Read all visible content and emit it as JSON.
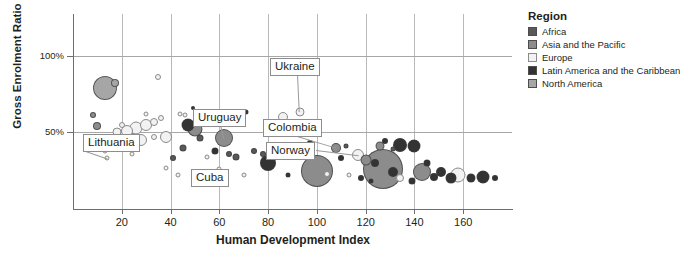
{
  "chart_data": {
    "type": "scatter",
    "title": "",
    "xlabel": "Human Development Index",
    "ylabel": "Gross Enrolment Ratio",
    "xlim": [
      0,
      180
    ],
    "ylim": [
      0,
      127
    ],
    "xticks": [
      20,
      40,
      60,
      80,
      100,
      120,
      140,
      160
    ],
    "yticks": [
      50,
      100
    ],
    "ytick_labels": [
      "50%",
      "100%"
    ],
    "grid": "both",
    "legend_position": "right",
    "legend_title": "Region",
    "series": [
      {
        "name": "Africa",
        "color": "#595959"
      },
      {
        "name": "Asia and the Pacific",
        "color": "#8c8c8c"
      },
      {
        "name": "Europe",
        "color": "#f2f2f2"
      },
      {
        "name": "Latin America and the Caribbean",
        "color": "#333333"
      },
      {
        "name": "North America",
        "color": "#a6a6a6"
      }
    ],
    "annotations": [
      {
        "label": "Lithuania",
        "x": 14,
        "y": 33
      },
      {
        "label": "Uruguay",
        "x": 62,
        "y": 46
      },
      {
        "label": "Cuba",
        "x": 60,
        "y": 26
      },
      {
        "label": "Ukraine",
        "x": 93,
        "y": 63
      },
      {
        "label": "Colombia",
        "x": 108,
        "y": 40
      },
      {
        "label": "Norway",
        "x": 117,
        "y": 35
      }
    ],
    "points": [
      {
        "x": 8,
        "y": 61,
        "r": 3.0,
        "region": "Asia and the Pacific"
      },
      {
        "x": 10,
        "y": 54,
        "r": 4.0,
        "region": "Asia and the Pacific"
      },
      {
        "x": 13,
        "y": 79,
        "r": 12.0,
        "region": "North America"
      },
      {
        "x": 17,
        "y": 82,
        "r": 4.0,
        "region": "North America"
      },
      {
        "x": 11,
        "y": 44,
        "r": 2.5,
        "region": "Europe"
      },
      {
        "x": 15,
        "y": 47,
        "r": 3.0,
        "region": "Europe"
      },
      {
        "x": 13,
        "y": 38,
        "r": 2.5,
        "region": "Europe"
      },
      {
        "x": 18,
        "y": 50,
        "r": 4.5,
        "region": "Europe"
      },
      {
        "x": 20,
        "y": 55,
        "r": 3.0,
        "region": "Europe"
      },
      {
        "x": 22,
        "y": 51,
        "r": 6.0,
        "region": "Europe"
      },
      {
        "x": 26,
        "y": 53,
        "r": 6.5,
        "region": "Europe"
      },
      {
        "x": 30,
        "y": 55,
        "r": 6.0,
        "region": "Europe"
      },
      {
        "x": 33,
        "y": 57,
        "r": 4.0,
        "region": "Europe"
      },
      {
        "x": 36,
        "y": 59,
        "r": 3.0,
        "region": "Europe"
      },
      {
        "x": 24,
        "y": 45,
        "r": 8.5,
        "region": "Asia and the Pacific"
      },
      {
        "x": 28,
        "y": 45,
        "r": 6.0,
        "region": "Europe"
      },
      {
        "x": 33,
        "y": 47,
        "r": 3.0,
        "region": "Europe"
      },
      {
        "x": 38,
        "y": 47,
        "r": 6.0,
        "region": "Europe"
      },
      {
        "x": 35,
        "y": 86,
        "r": 3.0,
        "region": "Europe"
      },
      {
        "x": 30,
        "y": 62,
        "r": 2.5,
        "region": "Europe"
      },
      {
        "x": 14,
        "y": 33,
        "r": 2.5,
        "region": "Europe"
      },
      {
        "x": 24,
        "y": 36,
        "r": 2.5,
        "region": "Europe"
      },
      {
        "x": 44,
        "y": 62,
        "r": 2.5,
        "region": "Europe"
      },
      {
        "x": 47,
        "y": 55,
        "r": 6.5,
        "region": "Latin America and the Caribbean"
      },
      {
        "x": 50,
        "y": 52,
        "r": 7.5,
        "region": "Asia and the Pacific"
      },
      {
        "x": 46,
        "y": 61,
        "r": 2.5,
        "region": "Europe"
      },
      {
        "x": 49,
        "y": 66,
        "r": 2.0,
        "region": "Latin America and the Caribbean"
      },
      {
        "x": 52,
        "y": 46,
        "r": 3.5,
        "region": "Africa"
      },
      {
        "x": 45,
        "y": 40,
        "r": 3.5,
        "region": "Africa"
      },
      {
        "x": 41,
        "y": 33,
        "r": 3.0,
        "region": "Africa"
      },
      {
        "x": 38,
        "y": 27,
        "r": 2.5,
        "region": "Europe"
      },
      {
        "x": 55,
        "y": 34,
        "r": 2.5,
        "region": "Europe"
      },
      {
        "x": 58,
        "y": 38,
        "r": 3.5,
        "region": "Latin America and the Caribbean"
      },
      {
        "x": 60,
        "y": 26,
        "r": 2.5,
        "region": "Europe"
      },
      {
        "x": 62,
        "y": 46,
        "r": 9.0,
        "region": "Asia and the Pacific"
      },
      {
        "x": 64,
        "y": 36,
        "r": 3.0,
        "region": "Africa"
      },
      {
        "x": 67,
        "y": 34,
        "r": 3.5,
        "region": "Africa"
      },
      {
        "x": 60,
        "y": 63,
        "r": 2.5,
        "region": "Europe"
      },
      {
        "x": 71,
        "y": 63,
        "r": 2.5,
        "region": "Latin America and the Caribbean"
      },
      {
        "x": 74,
        "y": 38,
        "r": 3.0,
        "region": "Africa"
      },
      {
        "x": 78,
        "y": 36,
        "r": 3.0,
        "region": "Africa"
      },
      {
        "x": 80,
        "y": 30,
        "r": 8.0,
        "region": "Latin America and the Caribbean"
      },
      {
        "x": 86,
        "y": 60,
        "r": 5.0,
        "region": "Europe"
      },
      {
        "x": 93,
        "y": 63,
        "r": 4.5,
        "region": "Europe"
      },
      {
        "x": 90,
        "y": 41,
        "r": 4.0,
        "region": "Africa"
      },
      {
        "x": 95,
        "y": 36,
        "r": 4.5,
        "region": "Asia and the Pacific"
      },
      {
        "x": 97,
        "y": 43,
        "r": 3.0,
        "region": "Latin America and the Caribbean"
      },
      {
        "x": 100,
        "y": 25,
        "r": 16.0,
        "region": "Asia and the Pacific"
      },
      {
        "x": 104,
        "y": 23,
        "r": 3.0,
        "region": "Europe"
      },
      {
        "x": 108,
        "y": 40,
        "r": 5.0,
        "region": "Asia and the Pacific"
      },
      {
        "x": 112,
        "y": 41,
        "r": 2.5,
        "region": "Africa"
      },
      {
        "x": 117,
        "y": 35,
        "r": 6.0,
        "region": "Europe"
      },
      {
        "x": 110,
        "y": 33,
        "r": 3.0,
        "region": "Latin America and the Caribbean"
      },
      {
        "x": 120,
        "y": 32,
        "r": 5.5,
        "region": "Asia and the Pacific"
      },
      {
        "x": 124,
        "y": 30,
        "r": 4.0,
        "region": "Latin America and the Caribbean"
      },
      {
        "x": 126,
        "y": 41,
        "r": 4.5,
        "region": "Asia and the Pacific"
      },
      {
        "x": 131,
        "y": 39,
        "r": 2.5,
        "region": "Africa"
      },
      {
        "x": 128,
        "y": 44,
        "r": 3.0,
        "region": "Latin America and the Caribbean"
      },
      {
        "x": 134,
        "y": 42,
        "r": 7.0,
        "region": "Latin America and the Caribbean"
      },
      {
        "x": 140,
        "y": 41,
        "r": 6.5,
        "region": "Latin America and the Caribbean"
      },
      {
        "x": 127,
        "y": 26,
        "r": 20.0,
        "region": "Asia and the Pacific"
      },
      {
        "x": 131,
        "y": 24,
        "r": 5.0,
        "region": "Latin America and the Caribbean"
      },
      {
        "x": 134,
        "y": 20,
        "r": 4.0,
        "region": "Europe"
      },
      {
        "x": 143,
        "y": 24,
        "r": 9.0,
        "region": "Asia and the Pacific"
      },
      {
        "x": 139,
        "y": 18,
        "r": 3.5,
        "region": "Latin America and the Caribbean"
      },
      {
        "x": 148,
        "y": 21,
        "r": 4.0,
        "region": "Latin America and the Caribbean"
      },
      {
        "x": 151,
        "y": 24,
        "r": 5.0,
        "region": "Latin America and the Caribbean"
      },
      {
        "x": 155,
        "y": 20,
        "r": 5.5,
        "region": "Latin America and the Caribbean"
      },
      {
        "x": 158,
        "y": 22,
        "r": 7.5,
        "region": "Europe"
      },
      {
        "x": 163,
        "y": 20,
        "r": 4.5,
        "region": "Latin America and the Caribbean"
      },
      {
        "x": 168,
        "y": 21,
        "r": 6.5,
        "region": "Latin America and the Caribbean"
      },
      {
        "x": 173,
        "y": 20,
        "r": 3.0,
        "region": "Latin America and the Caribbean"
      },
      {
        "x": 145,
        "y": 30,
        "r": 3.5,
        "region": "Latin America and the Caribbean"
      },
      {
        "x": 118,
        "y": 20,
        "r": 3.0,
        "region": "Latin America and the Caribbean"
      },
      {
        "x": 113,
        "y": 22,
        "r": 2.5,
        "region": "Europe"
      },
      {
        "x": 122,
        "y": 18,
        "r": 2.5,
        "region": "Latin America and the Caribbean"
      },
      {
        "x": 88,
        "y": 22,
        "r": 2.5,
        "region": "Latin America and the Caribbean"
      },
      {
        "x": 70,
        "y": 22,
        "r": 2.5,
        "region": "Europe"
      },
      {
        "x": 55,
        "y": 20,
        "r": 2.5,
        "region": "Europe"
      },
      {
        "x": 43,
        "y": 22,
        "r": 2.5,
        "region": "Europe"
      }
    ]
  },
  "legend": {
    "title": "Region",
    "items": [
      {
        "label": "Africa",
        "color": "#595959"
      },
      {
        "label": "Asia and the Pacific",
        "color": "#8c8c8c"
      },
      {
        "label": "Europe",
        "color": "#f2f2f2"
      },
      {
        "label": "Latin America and the Caribbean",
        "color": "#333333"
      },
      {
        "label": "North America",
        "color": "#a6a6a6"
      }
    ]
  }
}
